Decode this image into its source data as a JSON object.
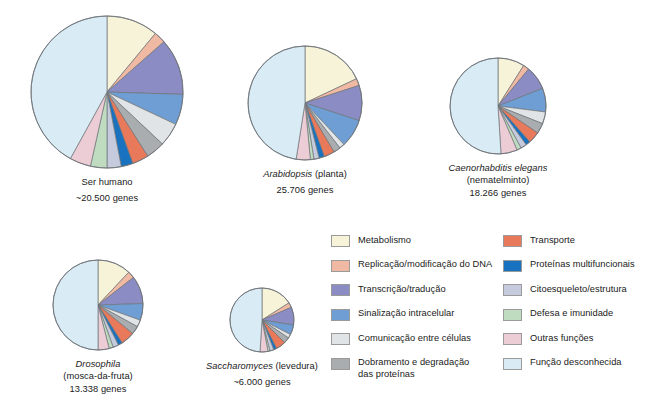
{
  "figure": {
    "background": "#ffffff",
    "type": "pie-chart-set"
  },
  "palette": {
    "metabolism": "#f7f3d8",
    "dna_replication": "#efb9a3",
    "transcription_translation": "#8b8cc4",
    "intracellular_signaling": "#6e9ed4",
    "cell_communication": "#e0e4e6",
    "protein_folding_degradation": "#a9adb0",
    "transport": "#e8795a",
    "multifunctional_proteins": "#1872c0",
    "cytoskeleton_structure": "#c5cbdd",
    "defense_immunity": "#bfdcc0",
    "other_functions": "#eccdd6",
    "unknown_function": "#d9ecf6",
    "outline": "#6f7479"
  },
  "legend": {
    "columns": [
      {
        "name": "legend-column-left",
        "items": [
          {
            "key": "metabolism",
            "label": "Metabolismo",
            "color": "#f7f3d8"
          },
          {
            "key": "dna_replication",
            "label": "Replicação/modificação do DNA",
            "color": "#efb9a3"
          },
          {
            "key": "transcription_translation",
            "label": "Transcrição/tradução",
            "color": "#8b8cc4"
          },
          {
            "key": "intracellular_signaling",
            "label": "Sinalização intracelular",
            "color": "#6e9ed4"
          },
          {
            "key": "cell_communication",
            "label": "Comunicação entre células",
            "color": "#e0e4e6"
          },
          {
            "key": "protein_folding_degradation",
            "label": "Dobramento e degradação",
            "label_line2": "das proteínas",
            "color": "#a9adb0"
          }
        ]
      },
      {
        "name": "legend-column-right",
        "items": [
          {
            "key": "transport",
            "label": "Transporte",
            "color": "#e8795a"
          },
          {
            "key": "multifunctional_proteins",
            "label": "Proteínas multifuncionais",
            "color": "#1872c0"
          },
          {
            "key": "cytoskeleton_structure",
            "label": "Citoesqueleto/estrutura",
            "color": "#c5cbdd"
          },
          {
            "key": "defense_immunity",
            "label": "Defesa e imunidade",
            "color": "#bfdcc0"
          },
          {
            "key": "other_functions",
            "label": "Outras funções",
            "color": "#eccdd6"
          },
          {
            "key": "unknown_function",
            "label": "Função desconhecida",
            "color": "#d9ecf6"
          }
        ]
      }
    ]
  },
  "chart_data": {
    "type": "pie",
    "title": "",
    "note": "Distribuição funcional dos genes em cinco organismos. Cada fatia é uma categoria funcional; percentuais estimados a partir dos ângulos das fatias.",
    "categories": [
      "Metabolismo",
      "Replicação/modificação do DNA",
      "Transcrição/tradução",
      "Sinalização intracelular",
      "Comunicação entre células",
      "Dobramento e degradação das proteínas",
      "Transporte",
      "Proteínas multifuncionais",
      "Citoesqueleto/estrutura",
      "Defesa e imunidade",
      "Outras funções",
      "Função desconhecida"
    ],
    "category_colors": [
      "#f7f3d8",
      "#efb9a3",
      "#8b8cc4",
      "#6e9ed4",
      "#e0e4e6",
      "#a9adb0",
      "#e8795a",
      "#1872c0",
      "#c5cbdd",
      "#bfdcc0",
      "#eccdd6",
      "#d9ecf6"
    ],
    "charts": [
      {
        "id": "human",
        "name_line1": "Ser humano",
        "name_line2": "",
        "genes_label": "~20.500 genes",
        "radius_px": 76,
        "values": [
          11.0,
          2.5,
          12.0,
          6.5,
          5.0,
          4.0,
          3.5,
          2.5,
          3.0,
          3.5,
          4.5,
          42.0
        ]
      },
      {
        "id": "arabidopsis",
        "name_line1": "Arabidopsis",
        "name_line2": "(planta)",
        "genes_label": "25.706 genes",
        "radius_px": 57,
        "values": [
          18.0,
          2.0,
          10.0,
          8.0,
          1.5,
          2.0,
          3.0,
          1.5,
          1.5,
          1.0,
          4.0,
          47.5
        ]
      },
      {
        "id": "celegans",
        "name_line1": "Caenorhabditis elegans",
        "name_line2": "(nematelminto)",
        "genes_label": "18.266 genes",
        "radius_px": 48,
        "values": [
          9.0,
          2.0,
          8.0,
          8.0,
          4.0,
          3.5,
          4.0,
          1.5,
          2.0,
          1.5,
          5.5,
          51.0
        ]
      },
      {
        "id": "drosophila",
        "name_line1": "Drosophila",
        "name_line2": "(mosca-da-fruta)",
        "genes_label": "13.338 genes",
        "radius_px": 45,
        "values": [
          12.0,
          2.5,
          10.0,
          6.0,
          2.5,
          3.0,
          5.0,
          1.5,
          2.0,
          1.5,
          4.0,
          50.0
        ]
      },
      {
        "id": "saccharomyces",
        "name_line1": "Saccharomyces",
        "name_line2": "(levedura)",
        "genes_label": "~6.000 genes",
        "radius_px": 32,
        "values": [
          16.0,
          2.5,
          9.0,
          5.0,
          2.0,
          3.0,
          5.0,
          1.5,
          2.0,
          1.0,
          4.0,
          49.0
        ]
      }
    ]
  },
  "layout": {
    "panels": [
      {
        "id": "human",
        "left": 12,
        "top": 14,
        "width": 190
      },
      {
        "id": "arabidopsis",
        "left": 230,
        "top": 44,
        "width": 150
      },
      {
        "id": "celegans",
        "left": 418,
        "top": 56,
        "width": 160
      },
      {
        "id": "drosophila",
        "left": 18,
        "top": 258,
        "width": 160
      },
      {
        "id": "saccharomyces",
        "top": 286,
        "left": 182,
        "width": 160
      }
    ]
  }
}
